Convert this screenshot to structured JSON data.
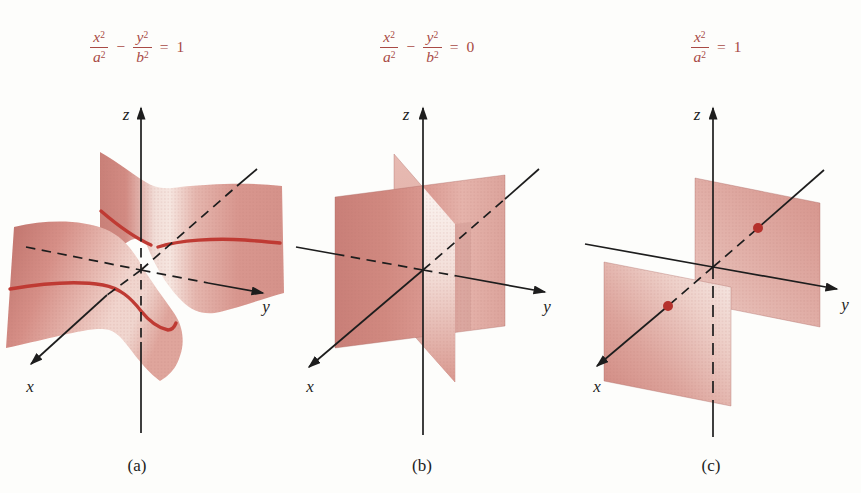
{
  "figure": {
    "background": "#fdfdfb",
    "formula_color": "#a84a45",
    "axis_color": "#1d1d1d",
    "trace_color": "#bf3a33",
    "dot_color": "#b5312c",
    "surface_light": "#f4e1db",
    "surface_dark": "#c97f78",
    "panels": [
      {
        "caption": "(a)",
        "surface_kind": "hyperbolic-cylinder",
        "axis_labels": {
          "x": "x",
          "y": "y",
          "z": "z"
        },
        "formula": {
          "t1n": "x",
          "t1ns": "2",
          "t1d": "a",
          "t1ds": "2",
          "op": "−",
          "t2n": "y",
          "t2ns": "2",
          "t2d": "b",
          "t2ds": "2",
          "eq": "=",
          "rhs": "1"
        }
      },
      {
        "caption": "(b)",
        "surface_kind": "pair-of-intersecting-planes",
        "axis_labels": {
          "x": "x",
          "y": "y",
          "z": "z"
        },
        "formula": {
          "t1n": "x",
          "t1ns": "2",
          "t1d": "a",
          "t1ds": "2",
          "op": "−",
          "t2n": "y",
          "t2ns": "2",
          "t2d": "b",
          "t2ds": "2",
          "eq": "=",
          "rhs": "0"
        }
      },
      {
        "caption": "(c)",
        "surface_kind": "pair-of-parallel-planes",
        "axis_labels": {
          "x": "x",
          "y": "y",
          "z": "z"
        },
        "formula": {
          "t1n": "x",
          "t1ns": "2",
          "t1d": "a",
          "t1ds": "2",
          "eq": "=",
          "rhs": "1"
        }
      }
    ]
  }
}
